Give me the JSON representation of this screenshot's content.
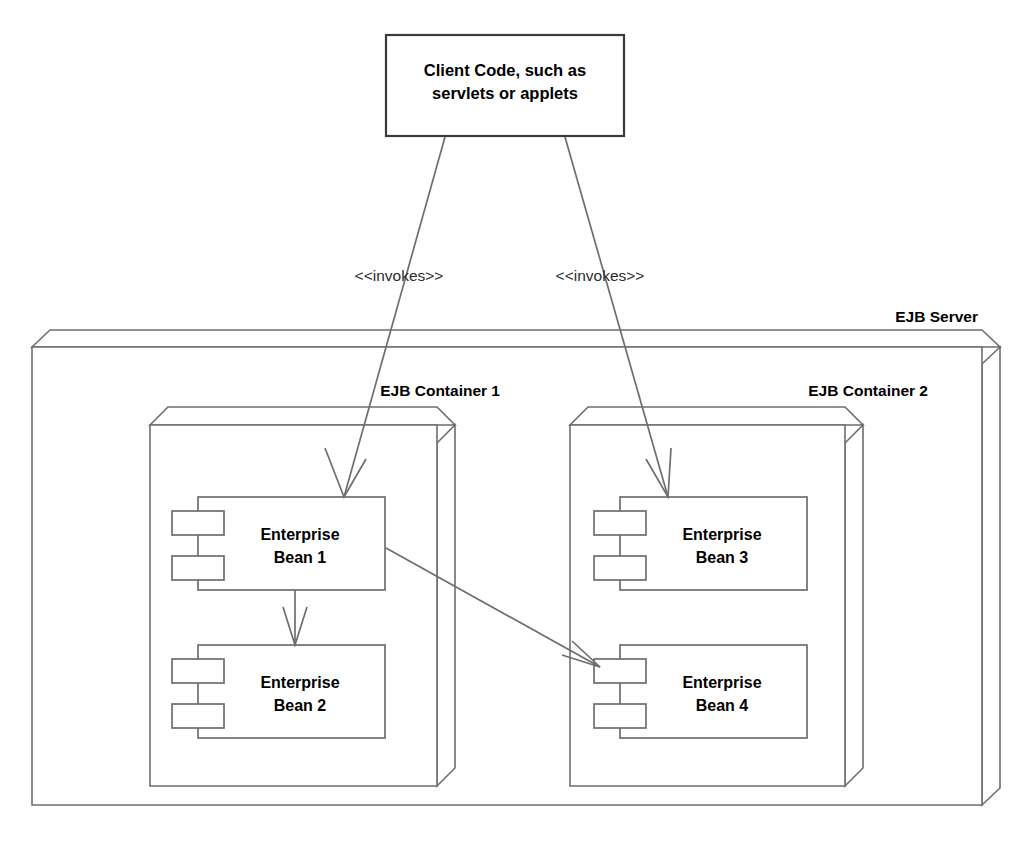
{
  "diagram": {
    "type": "uml-deployment",
    "background_color": "#ffffff",
    "line_color": "#6e6e6e",
    "text_color": "#000000",
    "client_border_color": "#3a3a3a"
  },
  "client": {
    "line1": "Client Code, such as",
    "line2": "servlets or applets"
  },
  "server": {
    "label": "EJB Server"
  },
  "containers": [
    {
      "label": "EJB Container 1"
    },
    {
      "label": "EJB Container 2"
    }
  ],
  "components": [
    {
      "line1": "Enterprise",
      "line2": "Bean 1"
    },
    {
      "line1": "Enterprise",
      "line2": "Bean 2"
    },
    {
      "line1": "Enterprise",
      "line2": "Bean 3"
    },
    {
      "line1": "Enterprise",
      "line2": "Bean 4"
    }
  ],
  "edges": [
    {
      "label": "<<invokes>>",
      "from": "client",
      "to": "Enterprise Bean 1"
    },
    {
      "label": "<<invokes>>",
      "from": "client",
      "to": "Enterprise Bean 3"
    },
    {
      "label": "",
      "from": "Enterprise Bean 1",
      "to": "Enterprise Bean 2"
    },
    {
      "label": "",
      "from": "Enterprise Bean 1",
      "to": "Enterprise Bean 4"
    }
  ]
}
